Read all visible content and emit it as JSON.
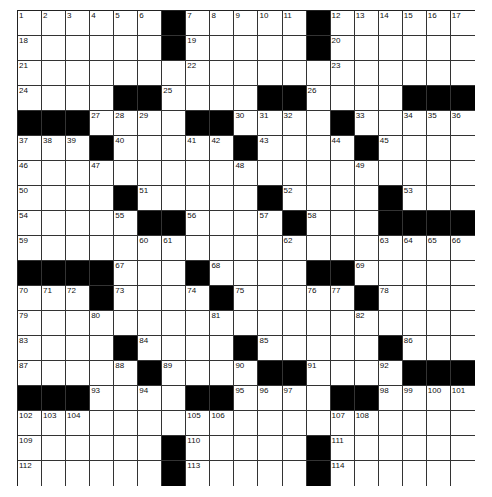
{
  "puzzle": {
    "cols": 19,
    "rows": 19,
    "colors": {
      "black": "#000000",
      "white": "#ffffff",
      "line": "#333333"
    },
    "grid": [
      [
        "1",
        "2",
        "3",
        "4",
        "5",
        "6",
        "#",
        "7",
        "8",
        "9",
        "10",
        "11",
        "#",
        "12",
        "13",
        "14",
        "15",
        "16",
        "17"
      ],
      [
        "18",
        "",
        "",
        "",
        "",
        "",
        "#",
        "19",
        "",
        "",
        "",
        "",
        "#",
        "20",
        "",
        "",
        "",
        "",
        ""
      ],
      [
        "21",
        "",
        "",
        "",
        "",
        "",
        "",
        "22",
        "",
        "",
        "",
        "",
        "",
        "23",
        "",
        "",
        "",
        "",
        ""
      ],
      [
        "24",
        "",
        "",
        "",
        "#",
        "#",
        "25",
        "",
        "",
        "",
        "#",
        "#",
        "26",
        "",
        "",
        "",
        "#",
        "#",
        "#"
      ],
      [
        "#",
        "#",
        "#",
        "27",
        "28",
        "29",
        "",
        "#",
        "#",
        "30",
        "31",
        "32",
        "",
        "#",
        "33",
        "",
        "34",
        "35",
        "36"
      ],
      [
        "37",
        "38",
        "39",
        "#",
        "40",
        "",
        "",
        "41",
        "42",
        "#",
        "43",
        "",
        "",
        "44",
        "#",
        "45",
        "",
        "",
        ""
      ],
      [
        "46",
        "",
        "",
        "47",
        "",
        "",
        "",
        "",
        "",
        "48",
        "",
        "",
        "",
        "",
        "49",
        "",
        "",
        "",
        ""
      ],
      [
        "50",
        "",
        "",
        "",
        "#",
        "51",
        "",
        "",
        "",
        "",
        "#",
        "52",
        "",
        "",
        "",
        "#",
        "53",
        "",
        ""
      ],
      [
        "54",
        "",
        "",
        "",
        "55",
        "#",
        "#",
        "56",
        "",
        "",
        "57",
        "#",
        "58",
        "",
        "",
        "#",
        "#",
        "#",
        "#"
      ],
      [
        "59",
        "",
        "",
        "",
        "",
        "60",
        "61",
        "",
        "",
        "",
        "",
        "62",
        "",
        "",
        "",
        "63",
        "64",
        "65",
        "66"
      ],
      [
        "#",
        "#",
        "#",
        "#",
        "67",
        "",
        "",
        "#",
        "68",
        "",
        "",
        "",
        "#",
        "#",
        "69",
        "",
        "",
        "",
        ""
      ],
      [
        "70",
        "71",
        "72",
        "#",
        "73",
        "",
        "",
        "74",
        "#",
        "75",
        "",
        "",
        "76",
        "77",
        "#",
        "78",
        "",
        "",
        ""
      ],
      [
        "79",
        "",
        "",
        "80",
        "",
        "",
        "",
        "",
        "81",
        "",
        "",
        "",
        "",
        "",
        "82",
        "",
        "",
        "",
        ""
      ],
      [
        "83",
        "",
        "",
        "",
        "#",
        "84",
        "",
        "",
        "",
        "#",
        "85",
        "",
        "",
        "",
        "",
        "#",
        "86",
        "",
        ""
      ],
      [
        "87",
        "",
        "",
        "",
        "88",
        "#",
        "89",
        "",
        "",
        "90",
        "#",
        "#",
        "91",
        "",
        "",
        "92",
        "#",
        "#",
        "#"
      ],
      [
        "#",
        "#",
        "#",
        "93",
        "",
        "94",
        "",
        "#",
        "#",
        "95",
        "96",
        "97",
        "",
        "#",
        "#",
        "98",
        "99",
        "100",
        "101"
      ],
      [
        "102",
        "103",
        "104",
        "",
        "",
        "",
        "",
        "105",
        "106",
        "",
        "",
        "",
        "",
        "107",
        "108",
        "",
        "",
        "",
        ""
      ],
      [
        "109",
        "",
        "",
        "",
        "",
        "",
        "#",
        "110",
        "",
        "",
        "",
        "",
        "#",
        "111",
        "",
        "",
        "",
        "",
        ""
      ],
      [
        "112",
        "",
        "",
        "",
        "",
        "",
        "#",
        "113",
        "",
        "",
        "",
        "",
        "#",
        "114",
        "",
        "",
        "",
        "",
        ""
      ]
    ]
  }
}
